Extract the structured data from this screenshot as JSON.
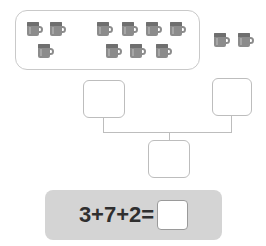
{
  "worksheet": {
    "type": "addition-number-bond",
    "group_box": {
      "label": "circled-group-of-mugs",
      "clusters": [
        {
          "name": "left-cluster",
          "count": 3
        },
        {
          "name": "right-cluster",
          "count": 7
        }
      ]
    },
    "outside_group": {
      "name": "ungrouped-mugs",
      "count": 2
    },
    "icon": "mug-icon",
    "mug_color": "#8c8c8c",
    "mug_rim_color": "#6f6f6f",
    "outline_color": "#c9c9c9"
  },
  "tree": {
    "boxes": [
      {
        "name": "left-addend-box",
        "value": ""
      },
      {
        "name": "right-addend-box",
        "value": ""
      },
      {
        "name": "total-box",
        "value": ""
      }
    ],
    "connector_color": "#bdbdbd"
  },
  "equation": {
    "bar_color": "#d4d4d4",
    "expression": "3+7+2=",
    "answer": ""
  },
  "mugs": {
    "left_top": [
      {
        "x": 27,
        "y": 22
      },
      {
        "x": 50,
        "y": 22
      }
    ],
    "left_bottom": [
      {
        "x": 38,
        "y": 44
      }
    ],
    "right_top": [
      {
        "x": 97,
        "y": 22
      },
      {
        "x": 122,
        "y": 22
      },
      {
        "x": 146,
        "y": 22
      },
      {
        "x": 170,
        "y": 22
      }
    ],
    "right_bottom": [
      {
        "x": 106,
        "y": 44
      },
      {
        "x": 130,
        "y": 44
      },
      {
        "x": 156,
        "y": 44
      }
    ],
    "outside": [
      {
        "x": 214,
        "y": 33
      },
      {
        "x": 238,
        "y": 33
      }
    ]
  }
}
